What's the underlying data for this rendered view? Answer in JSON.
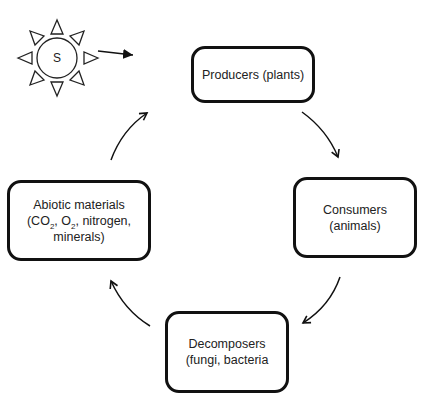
{
  "diagram": {
    "type": "cycle",
    "sun": {
      "label": "S",
      "icon": "sun-icon"
    },
    "nodes": {
      "producers": {
        "line1": "Producers (plants)"
      },
      "consumers": {
        "line1": "Consumers",
        "line2": "(animals)"
      },
      "decomposers": {
        "line1": "Decomposers",
        "line2": "(fungi, bacteria"
      },
      "abiotic": {
        "line1": "Abiotic materials",
        "line2_a": "(CO",
        "line2_sub1": "2",
        "line2_b": ", O",
        "line2_sub2": "2",
        "line2_c": ", nitrogen,",
        "line3": "minerals)"
      }
    },
    "edges": [
      {
        "from": "sun",
        "to": "producers"
      },
      {
        "from": "producers",
        "to": "consumers"
      },
      {
        "from": "consumers",
        "to": "decomposers"
      },
      {
        "from": "decomposers",
        "to": "abiotic"
      },
      {
        "from": "abiotic",
        "to": "producers"
      }
    ],
    "colors": {
      "stroke": "#111111",
      "background": "#ffffff"
    }
  }
}
